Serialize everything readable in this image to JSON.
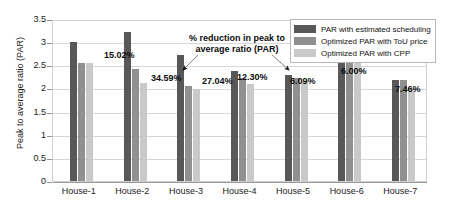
{
  "chart_data": {
    "type": "bar",
    "title": "",
    "xlabel": "",
    "ylabel": "Peak to average ratio (PAR)",
    "ylim": [
      0,
      3.5
    ],
    "yticks": [
      0,
      0.5,
      1,
      1.5,
      2,
      2.5,
      3,
      3.5
    ],
    "ytick_labels": [
      "0",
      "0.5",
      "1",
      "1.5",
      "2",
      "2.5",
      "3",
      "3.5"
    ],
    "grid": true,
    "legend_position": "top-right",
    "categories": [
      "House-1",
      "House-2",
      "House-3",
      "House-4",
      "House-5",
      "House-6",
      "House-7"
    ],
    "series": [
      {
        "name": "PAR with estimated scheduling",
        "color": "#585858",
        "values": [
          3.0,
          3.22,
          2.72,
          2.38,
          2.3,
          2.72,
          2.18
        ]
      },
      {
        "name": "Optimized PAR with ToU price",
        "color": "#909090",
        "values": [
          2.55,
          2.42,
          2.05,
          2.22,
          2.22,
          2.72,
          2.18
        ]
      },
      {
        "name": "Optimized PAR with CPP",
        "color": "#c9c9c9",
        "values": [
          2.55,
          2.11,
          1.99,
          2.09,
          2.16,
          2.55,
          2.02
        ]
      }
    ],
    "data_labels": [
      {
        "category": "House-1",
        "text": "15.02%"
      },
      {
        "category": "House-2",
        "text": "34.59%"
      },
      {
        "category": "House-3",
        "text": "27.04%"
      },
      {
        "category": "House-4",
        "text": "12.30%"
      },
      {
        "category": "House-5",
        "text": "6.09%"
      },
      {
        "category": "House-6",
        "text": "6.00%"
      },
      {
        "category": "House-7",
        "text": "7.46%"
      }
    ],
    "annotations": [
      {
        "text_line1": "% reduction in peak to",
        "text_line2": "average ratio (PAR)",
        "points_to": [
          "House-3",
          "House-5"
        ]
      }
    ]
  },
  "legend": {
    "items": [
      {
        "label": "PAR with estimated scheduling",
        "color": "#585858"
      },
      {
        "label": "Optimized PAR with ToU price",
        "color": "#909090"
      },
      {
        "label": "Optimized PAR with CPP",
        "color": "#c9c9c9"
      }
    ]
  },
  "axis": {
    "y_title": "Peak to average ratio (PAR)"
  }
}
